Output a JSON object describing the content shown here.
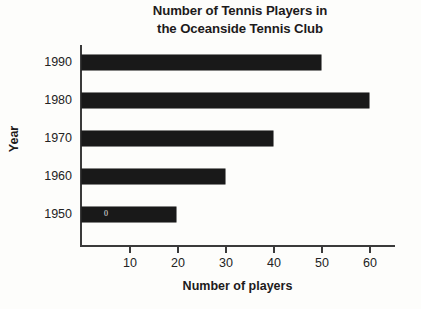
{
  "chart_data": {
    "type": "bar",
    "orientation": "horizontal",
    "title": "Number of Tennis Players in the Oceanside Tennis Club",
    "title_lines": [
      "Number of Tennis Players in",
      "the Oceanside Tennis Club"
    ],
    "categories": [
      "1990",
      "1980",
      "1970",
      "1960",
      "1950"
    ],
    "values": [
      50,
      60,
      40,
      30,
      20
    ],
    "xlabel": "Number of players",
    "ylabel": "Year",
    "xlim": [
      0,
      65
    ],
    "xticks": [
      10,
      20,
      30,
      40,
      50,
      60
    ],
    "xtick_labels": [
      "10",
      "20",
      "30",
      "40",
      "50",
      "60"
    ],
    "grid": false,
    "legend": null,
    "bar_color": "#191919",
    "axis_color": "#3a3a3a",
    "background_color": "#fdfdfb",
    "annotations": [
      {
        "series_index": 4,
        "text": "0",
        "note": "faint scan artifact inside the 1950 bar"
      }
    ]
  },
  "bars": [
    {
      "year": "1990",
      "value": 50,
      "label": "1990"
    },
    {
      "year": "1980",
      "value": 60,
      "label": "1980"
    },
    {
      "year": "1970",
      "value": 40,
      "label": "1970"
    },
    {
      "year": "1960",
      "value": 30,
      "label": "1960"
    },
    {
      "year": "1950",
      "value": 20,
      "label": "1950"
    }
  ],
  "artifact": {
    "text": "0"
  }
}
